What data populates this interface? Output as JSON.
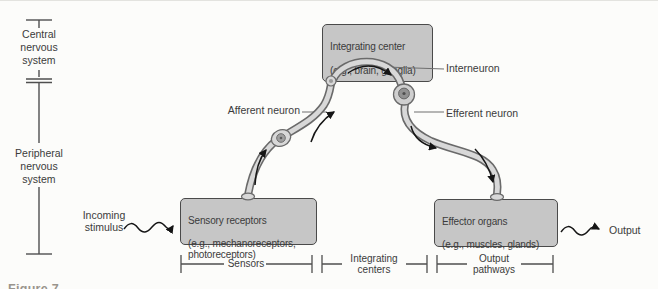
{
  "figure": {
    "caption_cropped": "Figure 7"
  },
  "side_axis": {
    "cns": "Central\nnervous\nsystem",
    "pns": "Peripheral\nnervous\nsystem"
  },
  "boxes": {
    "integrating_center": {
      "title": "Integrating center",
      "subtitle": "(e.g., brain, ganglia)"
    },
    "sensory_receptors": {
      "title": "Sensory receptors",
      "subtitle": "(e.g., mechanoreceptors,\nphotoreceptors)"
    },
    "effector_organs": {
      "title": "Effector organs",
      "subtitle": "(e.g., muscles, glands)"
    }
  },
  "neurons": {
    "interneuron": "Interneuron",
    "afferent": "Afferent neuron",
    "efferent": "Efferent neuron"
  },
  "io": {
    "incoming": "Incoming\nstimulus",
    "output": "Output"
  },
  "brackets": {
    "sensors": "Sensors",
    "integrating_centers": "Integrating\ncenters",
    "output_pathways": "Output\npathways"
  },
  "colors": {
    "background": "#fcfcfa",
    "box_fill": "#c6c6c6",
    "box_border": "#4a4a4a",
    "neuron_fill": "#d8d8d8",
    "neuron_outline": "#6a6a6a",
    "soma_nucleus": "#919191",
    "axis_line": "#4f4f4f",
    "signal_arrow": "#151515",
    "text": "#3b3b3b"
  }
}
